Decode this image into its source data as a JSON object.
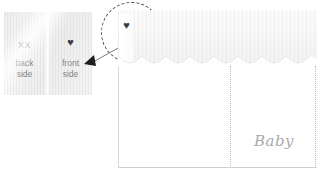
{
  "diagram": {
    "label_swatch": {
      "name": "care-label",
      "back": {
        "mark_text": "XX",
        "caption": "back\nside"
      },
      "front": {
        "mark_icon": "heart-icon",
        "mark_glyph": "♥",
        "caption": "front\nside"
      }
    },
    "callout": {
      "shape": "dashed-circle",
      "arrow_direction": "left",
      "target": "heart-label-tag"
    },
    "garment": {
      "name": "baby-eyelet-garment",
      "tag_icon": "heart-icon",
      "tag_glyph": "♥",
      "script_text": "Baby",
      "trim": "scalloped-eyelet-lace",
      "seam_style": "dotted"
    },
    "colors": {
      "label_fabric": "#f1f1f2",
      "text_gray": "#848587",
      "mark_gray": "#6f7072",
      "heart_dark": "#3b3b3d",
      "callout_stroke": "#4c4c4e",
      "script_gray": "#a9aaad",
      "seam_gray": "#b9babc",
      "garment_border": "#d7d8da"
    }
  }
}
